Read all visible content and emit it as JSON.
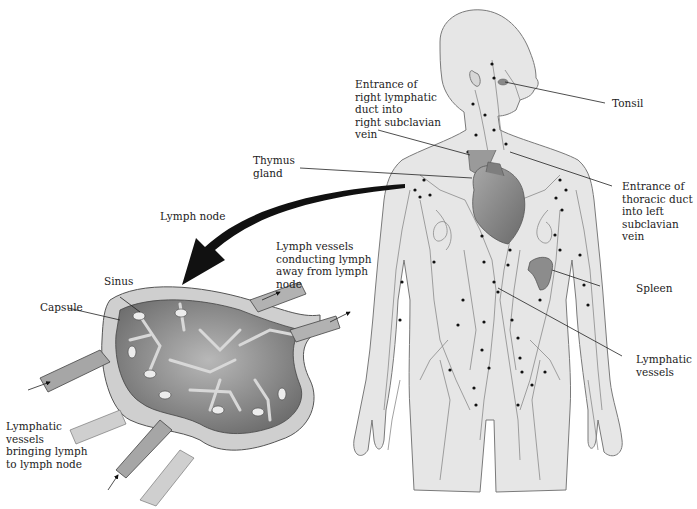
{
  "figure": {
    "colors": {
      "body_fill": "#e6e6e6",
      "body_outline": "#7a7a7a",
      "vessel": "#8a8a8a",
      "node_dot": "#111111",
      "heart": "#8f8f8f",
      "spleen": "#8c8c8c",
      "lymph_node_outer": "#cfcfcf",
      "lymph_node_inner": "#8e8e8e",
      "arrow": "#111111"
    }
  },
  "labels": {
    "right_lymphatic_duct": "Entrance of\nright lymphatic\nduct into\nright subclavian\nvein",
    "tonsil": "Tonsil",
    "thymus": "Thymus\ngland",
    "thoracic_duct": "Entrance of\nthoracic duct\ninto left\nsubclavian\nvein",
    "lymph_node": "Lymph node",
    "lymph_vessels_away": "Lymph vessels\nconducting lymph\naway from lymph\nnode",
    "sinus": "Sinus",
    "capsule": "Capsule",
    "spleen": "Spleen",
    "lymphatic_vessels": "Lymphatic\nvessels",
    "lymphatic_vessels_bringing": "Lymphatic\nvessels\nbringing lymph\nto lymph node"
  }
}
